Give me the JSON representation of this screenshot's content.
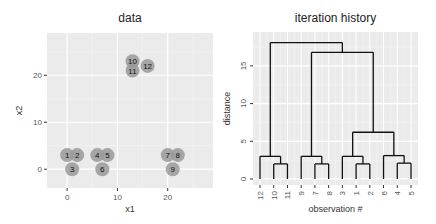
{
  "chart_data": [
    {
      "type": "scatter",
      "title": "data",
      "xlabel": "x1",
      "ylabel": "x2",
      "xlim": [
        -4,
        29
      ],
      "ylim": [
        -4,
        29
      ],
      "xticks": [
        0,
        10,
        20
      ],
      "yticks": [
        0,
        10,
        20
      ],
      "grid": true,
      "points": [
        {
          "label": "1",
          "x": 0,
          "y": 3
        },
        {
          "label": "2",
          "x": 2,
          "y": 3
        },
        {
          "label": "3",
          "x": 1,
          "y": 0
        },
        {
          "label": "4",
          "x": 6,
          "y": 3
        },
        {
          "label": "5",
          "x": 8,
          "y": 3
        },
        {
          "label": "6",
          "x": 7,
          "y": 0
        },
        {
          "label": "7",
          "x": 20,
          "y": 3
        },
        {
          "label": "8",
          "x": 22,
          "y": 3
        },
        {
          "label": "9",
          "x": 21,
          "y": 0
        },
        {
          "label": "10",
          "x": 13,
          "y": 23
        },
        {
          "label": "11",
          "x": 13,
          "y": 21
        },
        {
          "label": "12",
          "x": 16,
          "y": 22
        }
      ]
    },
    {
      "type": "dendrogram",
      "title": "iteration history",
      "xlabel": "observation #",
      "ylabel": "distance",
      "ylim": [
        -0.8,
        19.5
      ],
      "yticks": [
        0,
        5,
        10,
        15
      ],
      "grid": true,
      "leaf_order": [
        "12",
        "10",
        "11",
        "9",
        "7",
        "8",
        "3",
        "1",
        "2",
        "6",
        "4",
        "5"
      ],
      "merges": [
        {
          "id": "a",
          "left": "10",
          "right": "11",
          "height": 2.0
        },
        {
          "id": "b",
          "left": "12",
          "right": "a",
          "height": 3.0
        },
        {
          "id": "c",
          "left": "7",
          "right": "8",
          "height": 2.0
        },
        {
          "id": "d",
          "left": "9",
          "right": "c",
          "height": 3.0
        },
        {
          "id": "e",
          "left": "1",
          "right": "2",
          "height": 2.0
        },
        {
          "id": "f",
          "left": "3",
          "right": "e",
          "height": 3.0
        },
        {
          "id": "g",
          "left": "4",
          "right": "5",
          "height": 2.1
        },
        {
          "id": "h",
          "left": "6",
          "right": "g",
          "height": 3.1
        },
        {
          "id": "i",
          "left": "f",
          "right": "h",
          "height": 6.2
        },
        {
          "id": "j",
          "left": "d",
          "right": "i",
          "height": 16.8
        },
        {
          "id": "k",
          "left": "b",
          "right": "j",
          "height": 18.1
        }
      ]
    }
  ],
  "style": {
    "panel_bg": "#ebebeb",
    "grid_major": "#ffffff",
    "point_fill": "#999999",
    "line_color": "#111111"
  }
}
